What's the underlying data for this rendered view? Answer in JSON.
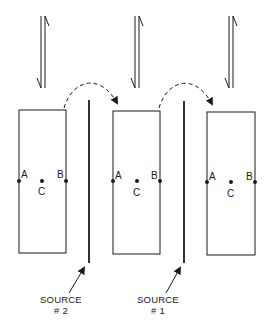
{
  "diagram": {
    "blocks": [
      {
        "id": "block-1",
        "x": 19,
        "y": 110,
        "w": 47,
        "h": 143,
        "points": {
          "A": "A",
          "B": "B",
          "C": "C"
        }
      },
      {
        "id": "block-2",
        "x": 113,
        "y": 111,
        "w": 47,
        "h": 143,
        "points": {
          "A": "A",
          "B": "B",
          "C": "C"
        }
      },
      {
        "id": "block-3",
        "x": 207,
        "y": 112,
        "w": 48,
        "h": 143,
        "points": {
          "A": "A",
          "B": "B",
          "C": "C"
        }
      }
    ],
    "sources": [
      {
        "id": "source-2",
        "label": "SOURCE",
        "number": "# 2",
        "x": 89
      },
      {
        "id": "source-1",
        "label": "SOURCE",
        "number": "# 1",
        "x": 185
      }
    ],
    "transfer_arrows": 2,
    "motion_arrows": 3,
    "line_color": "#1a1a1a"
  }
}
